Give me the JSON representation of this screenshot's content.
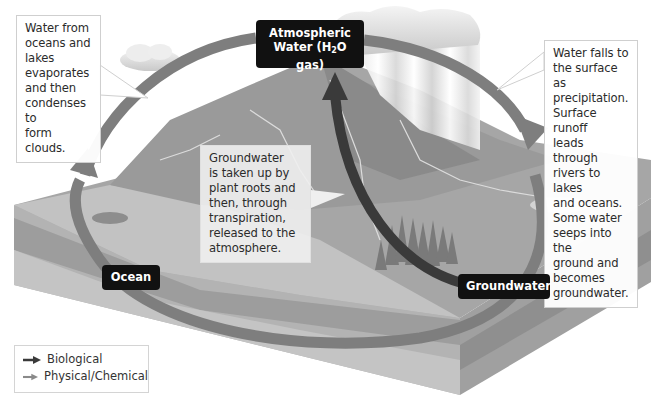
{
  "diagram": {
    "nodes": {
      "atmospheric": {
        "line1": "Atmospheric",
        "line2_pre": "Water (H",
        "line2_sub": "2",
        "line2_post": "O gas)"
      },
      "ocean": {
        "label": "Ocean"
      },
      "groundwater": {
        "label": "Groundwater"
      }
    },
    "callouts": {
      "evaporation": "Water from\noceans and\nlakes\nevaporates\nand then\ncondenses to\nform clouds.",
      "precipitation": "Water falls to\nthe surface as\nprecipitation.\nSurface runoff\nleads through\nrivers to lakes\nand oceans.\nSome water\nseeps into the\nground and\nbecomes\ngroundwater.",
      "transpiration": "Groundwater\nis taken up by\nplant roots and\nthen, through\ntranspiration,\nreleased to the\natmosphere."
    },
    "legend": {
      "items": [
        {
          "label": "Biological",
          "color": "#3a3a3a"
        },
        {
          "label": "Physical/Chemical",
          "color": "#8a8a8a"
        }
      ]
    },
    "colors": {
      "biological_arrow": "#3a3a3a",
      "physical_arrow": "#7e7e7e",
      "label_bg": "#111111",
      "terrain": "#a9a9a9",
      "soil_front": "#b8b8b8"
    }
  }
}
